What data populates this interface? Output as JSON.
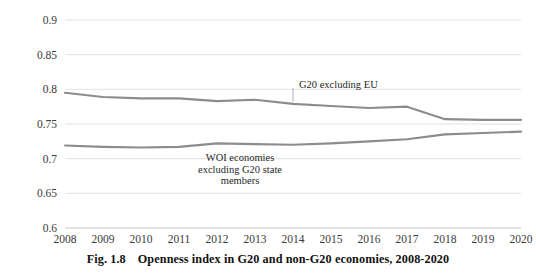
{
  "figure": {
    "caption_number": "Fig. 1.8",
    "caption_text": "Openness index in G20 and non-G20 economies, 2008-2020"
  },
  "colors": {
    "series_line": "#8c8c8c",
    "gridline": "#e2e2e2",
    "axis": "#c9c9c9",
    "text": "#262626",
    "background": "#ffffff"
  },
  "annotations": {
    "g20": {
      "label": "G20 excluding  EU",
      "anchor_year": 2014,
      "anchor_value": 0.779
    },
    "woi": {
      "line1": "WOI  economies",
      "line2": "excluding G20 state",
      "line3": "members"
    }
  },
  "chart_data": {
    "type": "line",
    "title": "Openness index in G20 and non-G20 economies, 2008-2020",
    "xlabel": "",
    "ylabel": "",
    "categories": [
      2008,
      2009,
      2010,
      2011,
      2012,
      2013,
      2014,
      2015,
      2016,
      2017,
      2018,
      2019,
      2020
    ],
    "x": [
      "2008",
      "2009",
      "2010",
      "2011",
      "2012",
      "2013",
      "2014",
      "2015",
      "2016",
      "2017",
      "2018",
      "2019",
      "2020"
    ],
    "ylim": [
      0.6,
      0.9
    ],
    "yticks": [
      0.6,
      0.65,
      0.7,
      0.75,
      0.8,
      0.85,
      0.9
    ],
    "ytick_labels": [
      "0.6",
      "0.65",
      "0.7",
      "0.75",
      "0.8",
      "0.85",
      "0.9"
    ],
    "grid": true,
    "legend": "none (in-plot annotations)",
    "series": [
      {
        "name": "G20 excluding EU",
        "values": [
          0.795,
          0.789,
          0.787,
          0.787,
          0.783,
          0.785,
          0.779,
          0.776,
          0.773,
          0.775,
          0.757,
          0.756,
          0.756
        ]
      },
      {
        "name": "WOI economies excluding G20 state members",
        "values": [
          0.719,
          0.717,
          0.716,
          0.717,
          0.722,
          0.721,
          0.72,
          0.722,
          0.725,
          0.728,
          0.735,
          0.737,
          0.739
        ]
      }
    ]
  }
}
